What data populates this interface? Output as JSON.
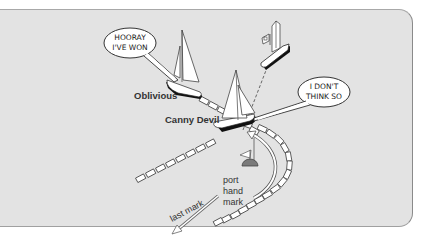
{
  "diagram": {
    "boats": [
      {
        "name": "Oblivious",
        "speech": [
          "HOORAY",
          "I'VE WON"
        ]
      },
      {
        "name": "Canny Devil",
        "speech": [
          "I DON'T",
          "THINK SO"
        ]
      }
    ],
    "labels": {
      "mark_line1": "port",
      "mark_line2": "hand",
      "mark_line3": "mark",
      "last_mark": "last mark"
    },
    "colors": {
      "panel_bg": "#e3e3e3",
      "hull_dark": "#111111",
      "sail": "#ffffff",
      "mark_buoy": "#7a7a7a"
    }
  }
}
